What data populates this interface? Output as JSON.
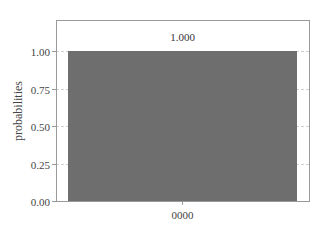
{
  "chart_data": {
    "type": "bar",
    "title": "",
    "xlabel": "",
    "ylabel": "probabilities",
    "categories": [
      "0000"
    ],
    "values": [
      1.0
    ],
    "bar_labels": [
      "1.000"
    ],
    "ylim": [
      0,
      1.1
    ],
    "yticks": [
      0.0,
      0.25,
      0.5,
      0.75,
      1.0
    ],
    "ytick_labels": [
      "0.00",
      "0.25",
      "0.50",
      "0.75",
      "1.00"
    ],
    "grid": "horizontal dashed",
    "legend": null,
    "colors": {
      "bar": "#6e6e6e",
      "frame": "#9a9a9a",
      "grid": "#d0d0d0"
    }
  }
}
